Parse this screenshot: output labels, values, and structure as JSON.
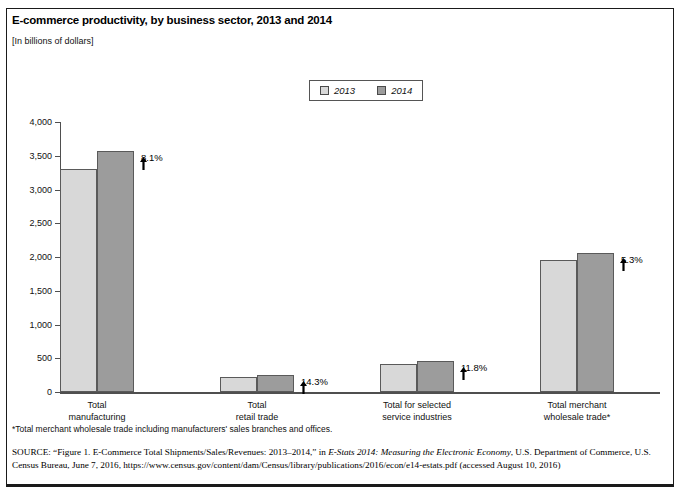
{
  "figure": {
    "title": "E-commerce productivity, by business sector, 2013 and 2014",
    "units_note": "[In billions of dollars]",
    "footnote": "*Total merchant wholesale trade including manufacturers' sales branches and offices.",
    "source_label": "SOURCE:",
    "source_part1": " “Figure 1. E-Commerce Total Shipments/Sales/Revenues: 2013–2014,” in ",
    "source_italic1": "E-Stats 2014: Measuring the Electronic Economy",
    "source_part2": ", U.S. Department of Commerce, U.S. Census Bureau, June 7, 2016, https://www.census.gov/content/dam/Census/library/publications/2016/econ/e14-estats.pdf (accessed August 10, 2016)"
  },
  "chart_data": {
    "type": "bar",
    "title": "E-commerce productivity, by business sector, 2013 and 2014",
    "subtitle": "[In billions of dollars]",
    "xlabel": "",
    "ylabel": "",
    "ylim": [
      0,
      4000
    ],
    "ytick_labels": [
      "0",
      "500",
      "1,000",
      "1,500",
      "2,000",
      "2,500",
      "3,000",
      "3,500",
      "4,000"
    ],
    "ytick_values": [
      0,
      500,
      1000,
      1500,
      2000,
      2500,
      3000,
      3500,
      4000
    ],
    "grid": false,
    "legend_position": "top-center",
    "categories": [
      "Total manufacturing",
      "Total retail trade",
      "Total for selected service industries",
      "Total merchant wholesale trade*"
    ],
    "category_lines": [
      [
        "Total",
        "manufacturing"
      ],
      [
        "Total",
        "retail trade"
      ],
      [
        "Total for selected",
        "service industries"
      ],
      [
        "Total merchant",
        "wholesale trade*"
      ]
    ],
    "series": [
      {
        "name": "2013",
        "color": "#d8d8d8",
        "values": [
          3300,
          220,
          410,
          1960
        ]
      },
      {
        "name": "2014",
        "color": "#9c9c9c",
        "values": [
          3570,
          251,
          458,
          2064
        ]
      }
    ],
    "annotations": [
      {
        "category": "Total manufacturing",
        "text": "8.1%",
        "direction": "up"
      },
      {
        "category": "Total retail trade",
        "text": "14.3%",
        "direction": "up"
      },
      {
        "category": "Total for selected service industries",
        "text": "11.8%",
        "direction": "up"
      },
      {
        "category": "Total merchant wholesale trade*",
        "text": "5.3%",
        "direction": "up"
      }
    ]
  },
  "legend": {
    "items": [
      {
        "label": "2013",
        "color": "#d8d8d8"
      },
      {
        "label": "2014",
        "color": "#9c9c9c"
      }
    ]
  }
}
